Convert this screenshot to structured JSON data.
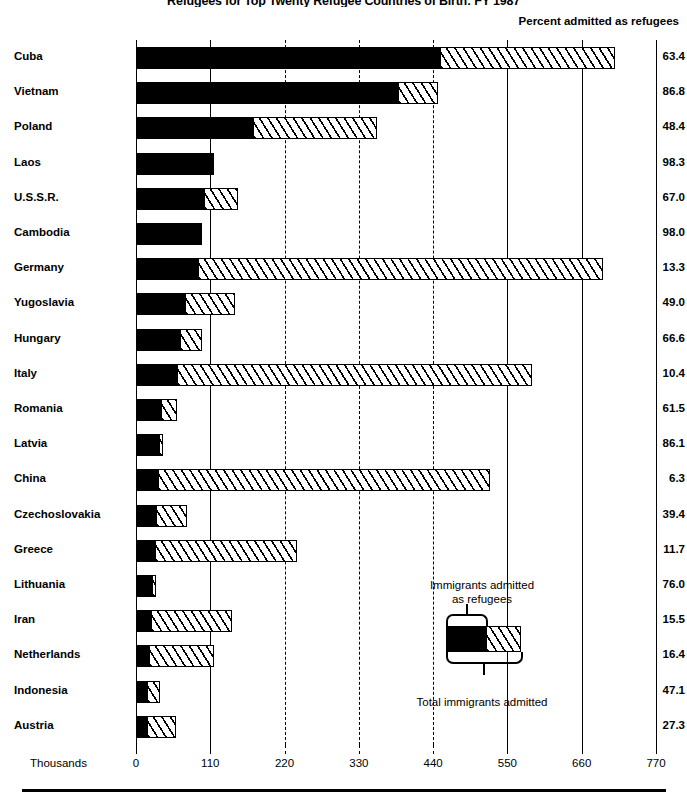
{
  "header": {
    "title": "Refugees for Top Twenty Refugee Countries of Birth: FY 1987",
    "percent_header": "Percent admitted as refugees"
  },
  "legend": {
    "top_label": "Immigrants admitted\nas refugees",
    "top_label_line1": "Immigrants admitted",
    "top_label_line2": "as refugees",
    "bottom_label": "Total immigrants admitted"
  },
  "axis": {
    "units_label": "Thousands",
    "ticks": [
      0,
      110,
      220,
      330,
      440,
      550,
      660,
      770
    ],
    "tick_labels": [
      "0",
      "110",
      "220",
      "330",
      "440",
      "550",
      "660",
      "770"
    ],
    "min": 0,
    "max": 770
  },
  "colors": {
    "refugee_fill": "#000000",
    "nonrefugee_fill": "#ffffff",
    "outline": "#000000",
    "background": "#ffffff"
  },
  "chart_data": {
    "type": "bar",
    "orientation": "horizontal",
    "stacked": true,
    "title": "Refugees for Top Twenty Refugee Countries of Birth: FY 1987",
    "xlabel": "Thousands",
    "ylabel": "",
    "xlim": [
      0,
      770
    ],
    "grid": true,
    "legend_position": "inside-bottom-right",
    "categories": [
      "Cuba",
      "Vietnam",
      "Poland",
      "Laos",
      "U.S.S.R.",
      "Cambodia",
      "Germany",
      "Yugoslavia",
      "Hungary",
      "Italy",
      "Romania",
      "Latvia",
      "China",
      "Czechoslovakia",
      "Greece",
      "Lithuania",
      "Iran",
      "Netherlands",
      "Indonesia",
      "Austria"
    ],
    "series": [
      {
        "name": "Immigrants admitted as refugees",
        "values": [
          450,
          388,
          173,
          112,
          101,
          95,
          92,
          72,
          65,
          61,
          37,
          34,
          33,
          30,
          28,
          23,
          22,
          19,
          17,
          16
        ]
      },
      {
        "name": "Total immigrants admitted",
        "values": [
          710,
          447,
          357,
          114,
          151,
          97,
          692,
          147,
          98,
          587,
          60,
          40,
          524,
          76,
          239,
          30,
          142,
          116,
          36,
          59
        ]
      }
    ],
    "percent_admitted_as_refugees": [
      63.4,
      86.8,
      48.4,
      98.3,
      67.0,
      98.0,
      13.3,
      49.0,
      66.6,
      10.4,
      61.5,
      86.1,
      6.3,
      39.4,
      11.7,
      76.0,
      15.5,
      16.4,
      47.1,
      27.3
    ],
    "percent_header": "Percent admitted as refugees"
  },
  "rows": [
    {
      "label": "Cuba",
      "refugees": 450,
      "total": 710,
      "percent": "63.4"
    },
    {
      "label": "Vietnam",
      "refugees": 388,
      "total": 447,
      "percent": "86.8"
    },
    {
      "label": "Poland",
      "refugees": 173,
      "total": 357,
      "percent": "48.4"
    },
    {
      "label": "Laos",
      "refugees": 112,
      "total": 114,
      "percent": "98.3"
    },
    {
      "label": "U.S.S.R.",
      "refugees": 101,
      "total": 151,
      "percent": "67.0"
    },
    {
      "label": "Cambodia",
      "refugees": 95,
      "total": 97,
      "percent": "98.0"
    },
    {
      "label": "Germany",
      "refugees": 92,
      "total": 692,
      "percent": "13.3"
    },
    {
      "label": "Yugoslavia",
      "refugees": 72,
      "total": 147,
      "percent": "49.0"
    },
    {
      "label": "Hungary",
      "refugees": 65,
      "total": 98,
      "percent": "66.6"
    },
    {
      "label": "Italy",
      "refugees": 61,
      "total": 587,
      "percent": "10.4"
    },
    {
      "label": "Romania",
      "refugees": 37,
      "total": 60,
      "percent": "61.5"
    },
    {
      "label": "Latvia",
      "refugees": 34,
      "total": 40,
      "percent": "86.1"
    },
    {
      "label": "China",
      "refugees": 33,
      "total": 524,
      "percent": "6.3"
    },
    {
      "label": "Czechoslovakia",
      "refugees": 30,
      "total": 76,
      "percent": "39.4"
    },
    {
      "label": "Greece",
      "refugees": 28,
      "total": 239,
      "percent": "11.7"
    },
    {
      "label": "Lithuania",
      "refugees": 23,
      "total": 30,
      "percent": "76.0"
    },
    {
      "label": "Iran",
      "refugees": 22,
      "total": 142,
      "percent": "15.5"
    },
    {
      "label": "Netherlands",
      "refugees": 19,
      "total": 116,
      "percent": "16.4"
    },
    {
      "label": "Indonesia",
      "refugees": 17,
      "total": 36,
      "percent": "47.1"
    },
    {
      "label": "Austria",
      "refugees": 16,
      "total": 59,
      "percent": "27.3"
    }
  ]
}
